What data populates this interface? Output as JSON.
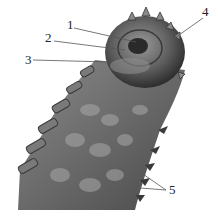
{
  "figure": {
    "type": "anatomical-illustration",
    "labels": [
      {
        "id": "1",
        "text": "1",
        "x": 67,
        "y": 22,
        "target": [
          136,
          42
        ]
      },
      {
        "id": "2",
        "text": "2",
        "x": 45,
        "y": 35,
        "target": [
          125,
          50
        ]
      },
      {
        "id": "3",
        "text": "3",
        "x": 25,
        "y": 54,
        "target": [
          110,
          62
        ]
      },
      {
        "id": "4",
        "text": "4",
        "x": 201,
        "y": 10,
        "target": [
          172,
          40
        ]
      },
      {
        "id": "5",
        "text": "5",
        "x": 168,
        "y": 184,
        "targets": [
          [
            140,
            172
          ],
          [
            140,
            188
          ]
        ]
      }
    ]
  }
}
